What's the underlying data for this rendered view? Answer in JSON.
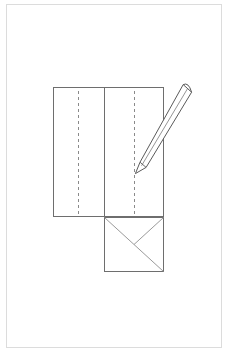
{
  "document": {
    "title": "Paper folding instruction diagram",
    "page_background": "#ffffff",
    "page_border_color": "#dcdcdc",
    "page_border": {
      "x": 6,
      "y": 4,
      "width": 216,
      "height": 344
    }
  },
  "palette": {
    "outline": "#6e6e6e",
    "fold_dashed": "#8a8a8a",
    "diagonal": "#9a9a9a",
    "pencil_stroke": "#5a5a5a",
    "pencil_fill": "#ffffff",
    "paper_fill": "#ffffff"
  },
  "diagram": {
    "name": "origami-fold-step",
    "upper_panel": {
      "label": "folded paper body",
      "x": 53,
      "y": 87,
      "width": 111,
      "height": 130,
      "fill": "#ffffff",
      "stroke": "#6e6e6e",
      "stroke_width": 1
    },
    "center_solid_fold": {
      "label": "center vertical crease",
      "x": 104,
      "y1": 87,
      "y2": 217,
      "stroke": "#6e6e6e",
      "stroke_width": 1
    },
    "dashed_folds": [
      {
        "label": "left dashed fold line",
        "x": 78,
        "y1": 91,
        "y2": 215,
        "stroke": "#8a8a8a",
        "dash": "3 3"
      },
      {
        "label": "right dashed fold line",
        "x": 134,
        "y1": 91,
        "y2": 215,
        "stroke": "#8a8a8a",
        "dash": "3 3"
      }
    ],
    "lower_square": {
      "label": "bottom square flap",
      "x": 104,
      "y": 217,
      "width": 60,
      "height": 55,
      "fill": "#ffffff",
      "stroke": "#6e6e6e",
      "stroke_width": 1
    },
    "square_diagonals": [
      {
        "label": "diagonal top-left to bottom-right",
        "x1": 104,
        "y1": 217,
        "x2": 164,
        "y2": 272,
        "stroke": "#9a9a9a"
      },
      {
        "label": "diagonal top-right to center",
        "x1": 164,
        "y1": 217,
        "x2": 134,
        "y2": 244,
        "stroke": "#9a9a9a"
      }
    ],
    "pencil": {
      "label": "pencil pointing at right fold line",
      "tip_x": 137,
      "tip_y": 172,
      "eraser_x": 188,
      "eraser_y": 88,
      "body_width": 9,
      "stroke": "#5a5a5a",
      "fill": "#ffffff",
      "stroke_width": 1
    }
  }
}
